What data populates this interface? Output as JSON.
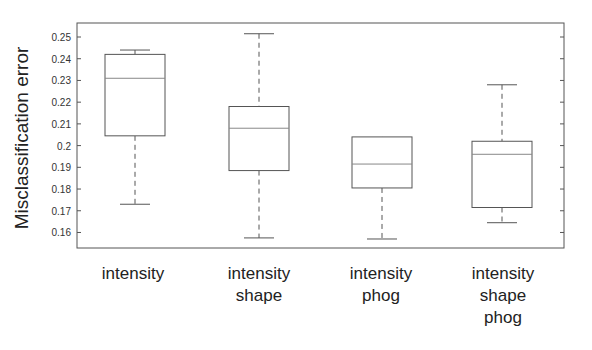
{
  "chart_data": {
    "type": "box",
    "title": "",
    "xlabel": "",
    "ylabel": "Misclassification error",
    "ylim": [
      0.152,
      0.257
    ],
    "yticks": [
      0.16,
      0.17,
      0.18,
      0.19,
      0.2,
      0.21,
      0.22,
      0.23,
      0.24,
      0.25
    ],
    "ytick_labels": [
      "0.16",
      "0.17",
      "0.18",
      "0.19",
      "0.2",
      "0.21",
      "0.22",
      "0.23",
      "0.24",
      "0.25"
    ],
    "grid": false,
    "legend": null,
    "categories": [
      [
        "intensity"
      ],
      [
        "intensity",
        "shape"
      ],
      [
        "intensity",
        "phog"
      ],
      [
        "intensity",
        "shape",
        "phog"
      ]
    ],
    "boxes": [
      {
        "name": "intensity",
        "whisker_high": 0.244,
        "q3": 0.242,
        "median": 0.231,
        "q1": 0.2045,
        "whisker_low": 0.173
      },
      {
        "name": "intensity shape",
        "whisker_high": 0.2515,
        "q3": 0.218,
        "median": 0.208,
        "q1": 0.1885,
        "whisker_low": 0.1575
      },
      {
        "name": "intensity phog",
        "whisker_high": 0.204,
        "q3": 0.204,
        "median": 0.1915,
        "q1": 0.1805,
        "whisker_low": 0.157
      },
      {
        "name": "intensity shape phog",
        "whisker_high": 0.228,
        "q3": 0.202,
        "median": 0.196,
        "q1": 0.1715,
        "whisker_low": 0.1645
      }
    ]
  },
  "colors": {
    "axis": "#555555",
    "box": "#555555",
    "median": "#888888",
    "whisker": "#555555"
  }
}
